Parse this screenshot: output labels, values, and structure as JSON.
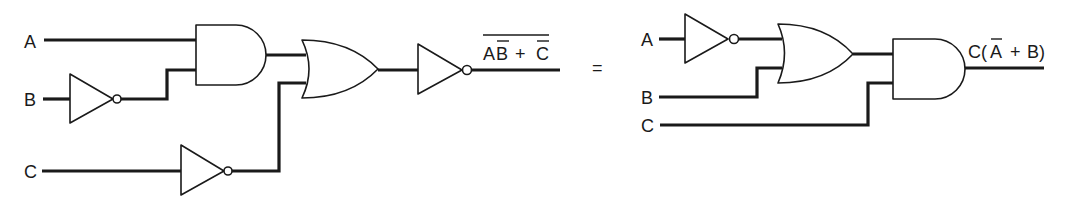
{
  "diagram": {
    "type": "logic-circuit-equivalence",
    "equals_sign": "=",
    "left_circuit": {
      "inputs": [
        "A",
        "B",
        "C"
      ],
      "gates": [
        {
          "id": "not_b",
          "type": "NOT",
          "input": "B",
          "output": "B̄"
        },
        {
          "id": "and1",
          "type": "AND",
          "inputs": [
            "A",
            "B̄"
          ],
          "output": "AB̄"
        },
        {
          "id": "not_c",
          "type": "NOT",
          "input": "C",
          "output": "C̄"
        },
        {
          "id": "or1",
          "type": "OR",
          "inputs": [
            "AB̄",
            "C̄"
          ],
          "output": "AB̄ + C̄"
        },
        {
          "id": "not_out",
          "type": "NOT",
          "input": "AB̄ + C̄",
          "output": "NOT(AB̄ + C̄)"
        }
      ],
      "output_label": {
        "text_parts": [
          "A",
          "B",
          " + ",
          "C"
        ],
        "plain": "AB + C",
        "overbars": [
          "B (single)",
          "C (single)",
          "entire expression"
        ]
      }
    },
    "right_circuit": {
      "inputs": [
        "A",
        "B",
        "C"
      ],
      "gates": [
        {
          "id": "not_a",
          "type": "NOT",
          "input": "A",
          "output": "Ā"
        },
        {
          "id": "or2",
          "type": "OR",
          "inputs": [
            "Ā",
            "B"
          ],
          "output": "Ā + B"
        },
        {
          "id": "and2",
          "type": "AND",
          "inputs": [
            "Ā + B",
            "C"
          ],
          "output": "C(Ā + B)"
        }
      ],
      "output_label": {
        "plain": "C(A + B)",
        "overbars": [
          "A (single)"
        ]
      }
    }
  },
  "labels": {
    "left_a": "A",
    "left_b": "B",
    "left_c": "C",
    "right_a": "A",
    "right_b": "B",
    "right_c": "C",
    "left_out_a": "A",
    "left_out_b": "B",
    "left_out_plus": "+",
    "left_out_c": "C",
    "equals": "=",
    "right_out_c": "C(",
    "right_out_a": "A",
    "right_out_plus": "+",
    "right_out_b": "B)"
  }
}
